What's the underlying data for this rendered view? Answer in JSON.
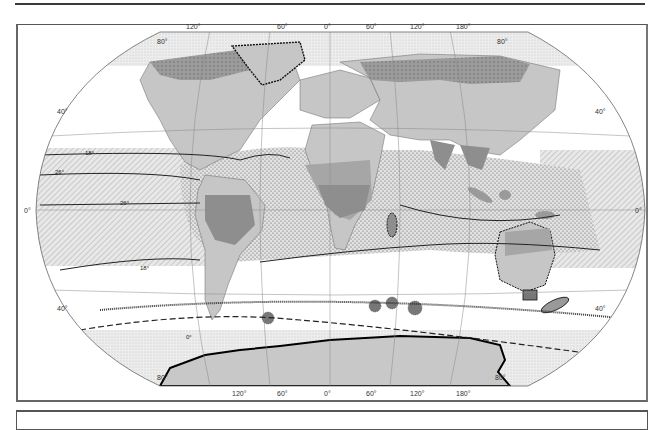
{
  "figure": {
    "type": "world map",
    "projection": "elliptical (pseudocylindrical) world projection"
  },
  "graticule": {
    "top_longitudes": [
      "120°",
      "60°",
      "0°",
      "60°",
      "120°",
      "180°"
    ],
    "bottom_longitudes": [
      "120°",
      "60°",
      "0°",
      "60°",
      "120°",
      "180°"
    ],
    "left_latitudes": [
      "80°",
      "40°",
      "0°",
      "40°",
      "80°"
    ],
    "right_latitudes": [
      "80°",
      "40°",
      "0°",
      "40°",
      "80°"
    ]
  },
  "isotherms": {
    "north_18": "18°",
    "north_26": "26°",
    "south_26": "26°",
    "south_18": "18°",
    "south_0": "0°"
  },
  "colors": {
    "ocean_white": "#ffffff",
    "stipple_light": "#e6e6e6",
    "land_light": "#c8c8c8",
    "land_medium": "#a9a9a9",
    "land_dark": "#8c8c8c",
    "tundra_hatched": "#9a9a9a",
    "tropical_dots": "#d9d9d9",
    "hatched_pacific": "#dcdcdc",
    "coast_dotted": "#111111"
  }
}
